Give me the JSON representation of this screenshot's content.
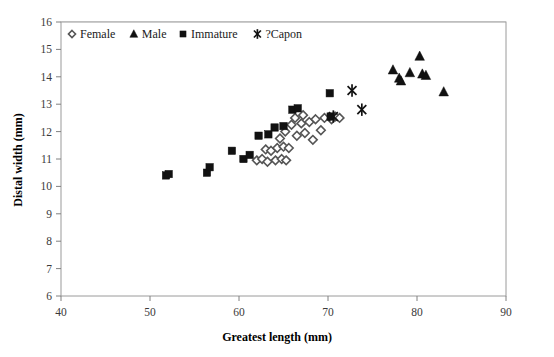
{
  "chart_data": {
    "type": "scatter",
    "title": "",
    "xlabel": "Greatest length (mm)",
    "ylabel": "Distal width (mm)",
    "xlim": [
      40,
      90
    ],
    "ylim": [
      6,
      16
    ],
    "xticks": [
      40,
      50,
      60,
      70,
      80,
      90
    ],
    "yticks": [
      6,
      7,
      8,
      9,
      10,
      11,
      12,
      13,
      14,
      15,
      16
    ],
    "grid": "horizontal",
    "legend_position": "top-left-inside",
    "series": [
      {
        "name": "Female",
        "marker": "diamond",
        "points": [
          [
            62.0,
            10.95
          ],
          [
            62.6,
            11.0
          ],
          [
            63.2,
            10.9
          ],
          [
            63.0,
            11.35
          ],
          [
            63.6,
            11.3
          ],
          [
            64.1,
            10.95
          ],
          [
            64.3,
            11.4
          ],
          [
            64.8,
            11.0
          ],
          [
            65.0,
            11.45
          ],
          [
            65.3,
            10.95
          ],
          [
            65.6,
            11.4
          ],
          [
            64.6,
            11.75
          ],
          [
            65.2,
            12.0
          ],
          [
            65.9,
            12.25
          ],
          [
            66.5,
            11.85
          ],
          [
            66.3,
            12.5
          ],
          [
            67.0,
            12.3
          ],
          [
            67.4,
            11.95
          ],
          [
            67.2,
            12.6
          ],
          [
            67.9,
            12.35
          ],
          [
            68.3,
            11.7
          ],
          [
            68.6,
            12.45
          ],
          [
            69.2,
            12.05
          ],
          [
            69.6,
            12.5
          ],
          [
            70.4,
            12.45
          ],
          [
            70.8,
            12.55
          ],
          [
            71.3,
            12.5
          ]
        ]
      },
      {
        "name": "Male",
        "marker": "triangle",
        "points": [
          [
            77.3,
            14.25
          ],
          [
            78.0,
            13.95
          ],
          [
            78.2,
            13.85
          ],
          [
            79.2,
            14.15
          ],
          [
            80.3,
            14.75
          ],
          [
            80.6,
            14.1
          ],
          [
            81.0,
            14.05
          ],
          [
            83.0,
            13.45
          ]
        ]
      },
      {
        "name": "Immature",
        "marker": "square",
        "points": [
          [
            51.8,
            10.4
          ],
          [
            52.1,
            10.45
          ],
          [
            56.4,
            10.5
          ],
          [
            56.7,
            10.7
          ],
          [
            59.2,
            11.3
          ],
          [
            60.5,
            11.0
          ],
          [
            61.2,
            11.15
          ],
          [
            62.2,
            11.85
          ],
          [
            63.3,
            11.9
          ],
          [
            64.0,
            12.15
          ],
          [
            65.0,
            12.2
          ],
          [
            66.0,
            12.8
          ],
          [
            66.6,
            12.85
          ],
          [
            70.2,
            13.4
          ],
          [
            70.3,
            12.55
          ]
        ]
      },
      {
        "name": "?Capon",
        "marker": "star",
        "points": [
          [
            72.7,
            13.5
          ],
          [
            70.6,
            12.55
          ],
          [
            73.8,
            12.8
          ]
        ]
      }
    ]
  },
  "legend": {
    "items": [
      {
        "label": "Female",
        "marker": "diamond"
      },
      {
        "label": "Male",
        "marker": "triangle"
      },
      {
        "label": "Immature",
        "marker": "square"
      },
      {
        "label": "?Capon",
        "marker": "star"
      }
    ]
  }
}
